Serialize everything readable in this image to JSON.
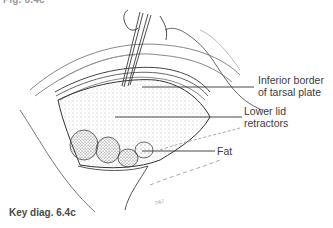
{
  "figure": {
    "header_partial": "Fig. 6.4c",
    "caption": "Key diag. 6.4c",
    "artist_signature": "7/67"
  },
  "labels": [
    {
      "id": "tarsal",
      "line1": "Inferior border",
      "line2": "of tarsal plate"
    },
    {
      "id": "retractors",
      "line1": "Lower lid",
      "line2": "retractors"
    },
    {
      "id": "fat",
      "line1": "Fat"
    }
  ],
  "colors": {
    "ink": "#3a3a3a",
    "stipple": "#8a8a8a",
    "background": "#ffffff"
  }
}
